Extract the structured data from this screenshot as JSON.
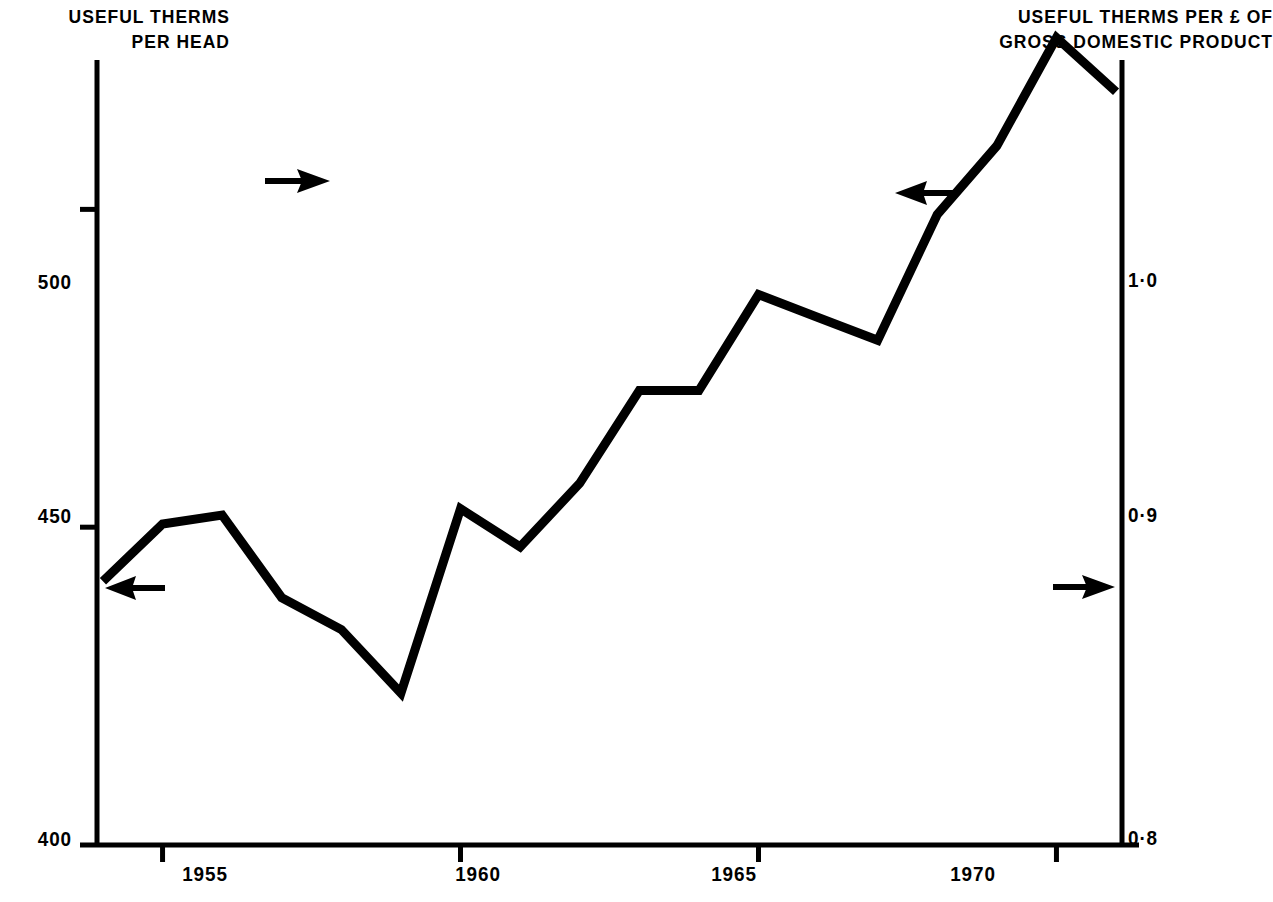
{
  "chart_data": {
    "type": "line",
    "title": "",
    "xlabel": "",
    "x_ticks": [
      "1955",
      "1960",
      "1965",
      "1970"
    ],
    "x_tick_values": [
      1955,
      1960,
      1965,
      1970
    ],
    "xlim": [
      1953.9,
      1971.1
    ],
    "grid": false,
    "legend": "none (arrows point from each curve to its axis)",
    "axes": [
      {
        "id": "left",
        "label": "USEFUL THERMS\nPER HEAD",
        "ticks": [
          "500",
          "450",
          "400"
        ],
        "tick_values": [
          500,
          450,
          400
        ],
        "ylim": [
          400,
          523.5
        ],
        "position": "left"
      },
      {
        "id": "right",
        "label": "USEFUL THERMS PER £ OF\nGROSS DOMESTIC PRODUCT",
        "ticks": [
          "1·0",
          "0·9",
          "0·8"
        ],
        "tick_values": [
          1.0,
          0.9,
          0.8
        ],
        "ylim": [
          0.8,
          0.8381
        ],
        "position": "right"
      }
    ],
    "series": [
      {
        "name": "Useful therms per head",
        "axis": "left",
        "style": "solid",
        "color": "#000000",
        "x": [
          1954,
          1955,
          1956,
          1957,
          1958,
          1959,
          1960,
          1961,
          1962,
          1963,
          1964,
          1965,
          1966,
          1967,
          1968,
          1969,
          1970,
          1971
        ],
        "values": [
          441.5,
          450.5,
          451.9,
          438.9,
          433.9,
          423.9,
          452.9,
          446.9,
          456.9,
          471.5,
          471.5,
          486.6,
          483.0,
          479.4,
          499.2,
          510.0,
          527.0,
          518.5
        ]
      },
      {
        "name": "Useful therms per £ of gross domestic product",
        "axis": "right",
        "style": "dashed",
        "color": "#000000",
        "x": [
          1954,
          1955,
          1956,
          1957,
          1958,
          1959,
          1960,
          1961,
          1962,
          1963,
          1964,
          1965,
          1966,
          1967,
          1968,
          1969,
          1970,
          1971
        ],
        "values": [
          1.072,
          1.058,
          1.046,
          1.0,
          0.996,
          0.954,
          0.963,
          0.937,
          0.944,
          0.945,
          0.899,
          0.903,
          0.884,
          0.871,
          0.88,
          0.89,
          0.9,
          0.883
        ]
      }
    ],
    "annotations": [
      {
        "name": "arrow-left-solid-to-left-axis",
        "text": "←",
        "direction": "left",
        "x": 1954.6,
        "y_axis": "left",
        "note": "solid curve belongs to left axis"
      },
      {
        "name": "arrow-upper-dashed-to-right-axis",
        "text": "→",
        "direction": "right",
        "x": 1956.2,
        "y_axis": "right",
        "note": "dashed curve belongs to right axis"
      },
      {
        "name": "arrow-upper-solid-to-left-axis",
        "text": "←",
        "direction": "left",
        "x": 1968.1,
        "y_axis": "left",
        "note": "solid curve belongs to left axis"
      },
      {
        "name": "arrow-right-dashed-to-right-axis",
        "text": "→",
        "direction": "right",
        "x": 1971.3,
        "y_axis": "right",
        "note": "dashed curve belongs to right axis"
      }
    ]
  },
  "left_axis": {
    "title": "USEFUL THERMS\nPER HEAD",
    "tick_500": "500",
    "tick_450": "450",
    "tick_400": "400"
  },
  "right_axis": {
    "title": "USEFUL THERMS PER £ OF\nGROSS DOMESTIC PRODUCT",
    "tick_10": "1·0",
    "tick_09": "0·9",
    "tick_08": "0·8"
  },
  "x_axis": {
    "tick_1955": "1955",
    "tick_1960": "1960",
    "tick_1965": "1965",
    "tick_1970": "1970"
  },
  "colors": {
    "ink": "#000000",
    "background": "#ffffff"
  }
}
